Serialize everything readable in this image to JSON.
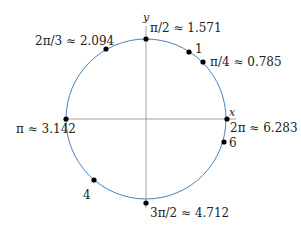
{
  "diagram": {
    "axes": {
      "x_label": "x",
      "y_label": "y"
    },
    "circle_color": "#4a7fc1",
    "axis_color": "#888888",
    "point_color": "#000000",
    "points": [
      {
        "id": "pi-over-4",
        "angle": 0.785,
        "label": "π/4 ≈ 0.785"
      },
      {
        "id": "one",
        "angle": 1,
        "label": "1"
      },
      {
        "id": "pi-over-2",
        "angle": 1.571,
        "label": "π/2 ≈ 1.571"
      },
      {
        "id": "two-pi-over-3",
        "angle": 2.094,
        "label": "2π/3 ≈ 2.094"
      },
      {
        "id": "pi",
        "angle": 3.142,
        "label": "π ≈ 3.142"
      },
      {
        "id": "four",
        "angle": 4,
        "label": "4"
      },
      {
        "id": "three-pi-over-2",
        "angle": 4.712,
        "label": "3π/2 ≈ 4.712"
      },
      {
        "id": "six",
        "angle": 6,
        "label": "6"
      },
      {
        "id": "two-pi",
        "angle": 6.283,
        "label": "2π ≈ 6.283"
      }
    ]
  }
}
